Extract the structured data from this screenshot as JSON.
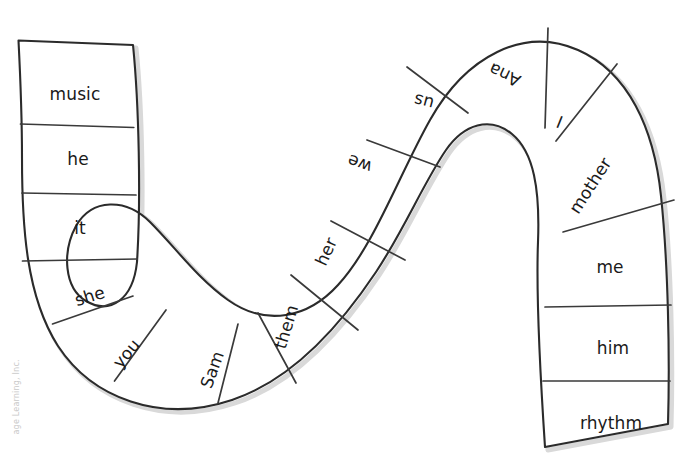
{
  "page": {
    "kind": "word-path-worksheet",
    "background_color": "#ffffff",
    "outline_color": "#2b2b2b",
    "divider_color": "#3a3a3a",
    "text_color": "#1a1a1a",
    "width": 683,
    "height": 465
  },
  "watermark": {
    "text": "age Learning, Inc.",
    "color": "#c9c9c9",
    "orientation": "vertical-left"
  },
  "path": {
    "shape": "s-curve-snake",
    "cell_count": 16,
    "direction": "starts top-left, curves down and around, up over arch, down right side"
  },
  "cells": [
    {
      "id": "cell-1",
      "label": "music",
      "rotation": 0,
      "x": 75,
      "y": 95,
      "segment": "left-band"
    },
    {
      "id": "cell-2",
      "label": "he",
      "rotation": 0,
      "x": 78,
      "y": 160,
      "segment": "left-band"
    },
    {
      "id": "cell-3",
      "label": "it",
      "rotation": 0,
      "x": 80,
      "y": 229,
      "segment": "left-band"
    },
    {
      "id": "cell-4",
      "label": "she",
      "rotation": -17,
      "x": 90,
      "y": 297,
      "segment": "bottom-left-curve"
    },
    {
      "id": "cell-5",
      "label": "you",
      "rotation": -50,
      "x": 127,
      "y": 354,
      "segment": "bottom-left-curve"
    },
    {
      "id": "cell-6",
      "label": "Sam",
      "rotation": -70,
      "x": 213,
      "y": 370,
      "segment": "bottom-left-curve"
    },
    {
      "id": "cell-7",
      "label": "them",
      "rotation": -73,
      "x": 287,
      "y": 327,
      "segment": "rising-diagonal"
    },
    {
      "id": "cell-8",
      "label": "her",
      "rotation": -65,
      "x": 327,
      "y": 252,
      "segment": "rising-diagonal"
    },
    {
      "id": "cell-9",
      "label": "we",
      "rotation": 200,
      "x": 360,
      "y": 163,
      "segment": "rising-diagonal"
    },
    {
      "id": "cell-10",
      "label": "us",
      "rotation": 195,
      "x": 424,
      "y": 101,
      "segment": "top-arch"
    },
    {
      "id": "cell-11",
      "label": "Ana",
      "rotation": 205,
      "x": 505,
      "y": 74,
      "segment": "top-arch"
    },
    {
      "id": "cell-12",
      "label": "I",
      "rotation": 202,
      "x": 560,
      "y": 121,
      "segment": "top-arch"
    },
    {
      "id": "cell-13",
      "label": "mother",
      "rotation": -57,
      "x": 591,
      "y": 186,
      "segment": "right-band"
    },
    {
      "id": "cell-14",
      "label": "me",
      "rotation": 0,
      "x": 610,
      "y": 268,
      "segment": "right-band"
    },
    {
      "id": "cell-15",
      "label": "him",
      "rotation": 0,
      "x": 613,
      "y": 349,
      "segment": "right-band"
    },
    {
      "id": "cell-16",
      "label": "rhythm",
      "rotation": 0,
      "x": 611,
      "y": 424,
      "segment": "right-band"
    }
  ],
  "geometry": {
    "outline_d": "M 18.5 40.5 L 133 45 C 139 105 141 200 137 262 C 133 300 110 315 86 301 C 64 288 62 252 76 226 C 92 198 126 198 150 222 C 176 248 197 278 228 300 C 266 327 308 318 338 285 C 374 246 399 175 430 120 C 466 56 524 26 578 50 C 628 72 654 128 661 196 C 668 262 670 356 668 424 L 545 447 C 540 372 536 294 538 242 C 540 190 534 152 512 134 C 490 116 464 124 446 150 C 424 182 404 230 376 272 C 340 326 292 380 232 400 C 160 424 92 398 58 346 C 26 296 22 226 22 158 C 22 110 20 70 18.5 40.5 Z",
    "dividers": [
      "M 20.5 124 L 133.8 127.5",
      "M 22 193 L 136 195",
      "M 22.5 261 L 137.2 259",
      "M 52.5 324 L 133 296",
      "M 114.5 381 L 166 310",
      "M 218 403 L 238 324",
      "M 296 383 L 258 313",
      "M 358 330 L 291 275",
      "M 405 260 L 331 221",
      "M 440 167 L 367 140",
      "M 468 113 L 407 67",
      "M 545 128 L 548 28",
      "M 556 141 L 617 64",
      "M 563 232 L 674 200",
      "M 545 307 L 671 305",
      "M 543 381 L 670 381"
    ]
  }
}
